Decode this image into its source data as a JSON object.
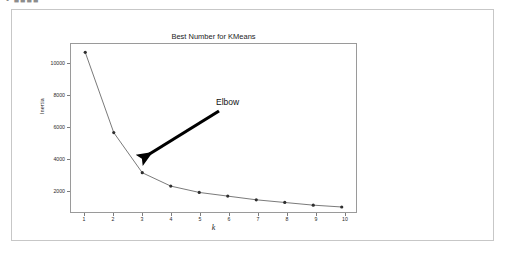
{
  "page": {
    "top_sliver_text": "• ■■■■"
  },
  "card": {
    "border_color": "#c7c7c7",
    "background": "#ffffff"
  },
  "chart_data": {
    "type": "line",
    "title": "Best Number for KMeans",
    "xlabel": "k",
    "ylabel": "Inertia",
    "x": [
      1,
      2,
      3,
      4,
      5,
      6,
      7,
      8,
      9,
      10
    ],
    "values": [
      10700,
      5900,
      3500,
      2700,
      2320,
      2100,
      1880,
      1720,
      1560,
      1450
    ],
    "categories": [
      "1",
      "2",
      "3",
      "4",
      "5",
      "6",
      "7",
      "8",
      "9",
      "10"
    ],
    "series": [
      {
        "name": "Inertia",
        "values": [
          10700,
          5900,
          3500,
          2700,
          2320,
          2100,
          1880,
          1720,
          1560,
          1450
        ]
      }
    ],
    "xlim": [
      0.5,
      10.5
    ],
    "ylim": [
      1150,
      11200
    ],
    "xticks": [
      "1",
      "2",
      "3",
      "4",
      "5",
      "6",
      "7",
      "8",
      "9",
      "10"
    ],
    "yticks": [
      "2000",
      "4000",
      "6000",
      "8000",
      "10000"
    ],
    "ytick_values": [
      2000,
      4000,
      6000,
      8000,
      10000
    ],
    "grid": false,
    "legend": false,
    "line_color": "#6b6b6b",
    "marker_color": "#2f2f2f",
    "marker": "circle",
    "annotations": [
      {
        "text": "Elbow",
        "points_to_x": 3,
        "points_to_y": 3500,
        "arrow_color": "#000000"
      }
    ]
  }
}
